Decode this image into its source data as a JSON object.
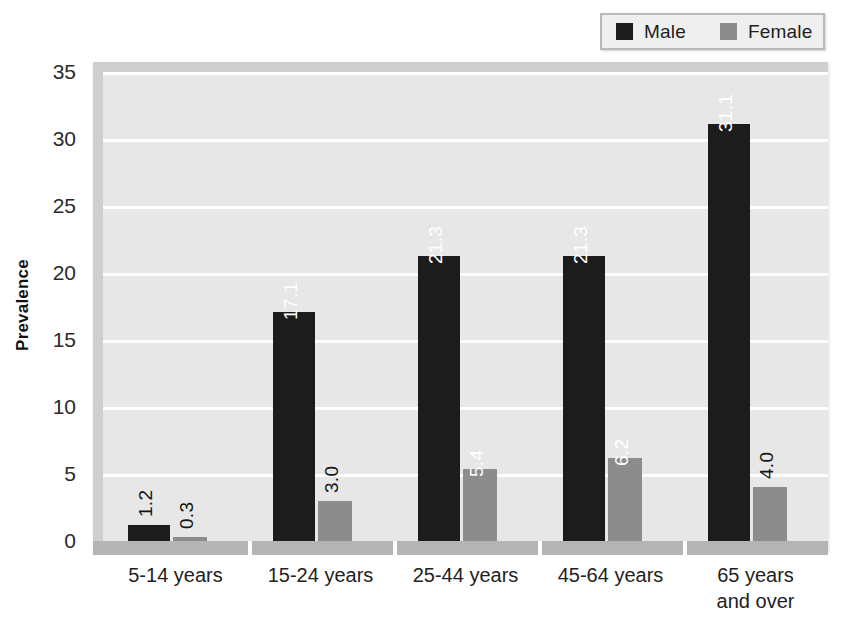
{
  "chart_data": {
    "type": "bar",
    "title": "",
    "xlabel": "",
    "ylabel": "Prevalence",
    "ylim": [
      0,
      35
    ],
    "yticks": [
      0,
      5,
      10,
      15,
      20,
      25,
      30,
      35
    ],
    "grid": true,
    "legend_position": "top-right",
    "categories": [
      "5-14 years",
      "15-24 years",
      "25-44 years",
      "45-64 years",
      "65 years and over"
    ],
    "category_lines": [
      [
        "5-14 years"
      ],
      [
        "15-24 years"
      ],
      [
        "25-44 years"
      ],
      [
        "45-64 years"
      ],
      [
        "65 years",
        "and over"
      ]
    ],
    "series": [
      {
        "name": "Male",
        "color": "#1c1c1c",
        "values": [
          1.2,
          17.1,
          21.3,
          21.3,
          31.1
        ],
        "labels": [
          "1.2",
          "17.1",
          "21.3",
          "21.3",
          "31.1"
        ]
      },
      {
        "name": "Female",
        "color": "#8c8c8c",
        "values": [
          0.3,
          3.0,
          5.4,
          6.2,
          4.0
        ],
        "labels": [
          "0.3",
          "3.0",
          "5.4",
          "6.2",
          "4.0"
        ]
      }
    ]
  },
  "legend": {
    "items": [
      {
        "label": "Male",
        "color": "#1c1c1c"
      },
      {
        "label": "Female",
        "color": "#8c8c8c"
      }
    ]
  },
  "axis": {
    "y_label": "Prevalence",
    "y_ticks": [
      "0",
      "5",
      "10",
      "15",
      "20",
      "25",
      "30",
      "35"
    ]
  },
  "colors": {
    "male": "#1c1c1c",
    "female": "#8c8c8c",
    "plot_background": "#e7e7e7",
    "gridline": "#ffffff",
    "frame": "#cfcfcf",
    "axis_band": "#b4b4b4",
    "legend_background": "#efefef",
    "legend_border": "#b9b9b9",
    "text": "#1a1a1a"
  }
}
